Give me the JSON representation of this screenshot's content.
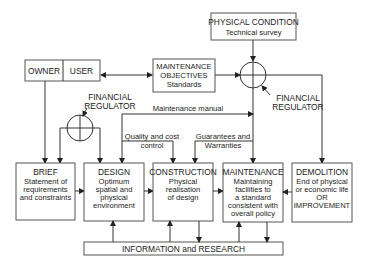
{
  "nodes": {
    "physical_condition": {
      "title": "PHYSICAL CONDITION",
      "sub": "Technical survey"
    },
    "maintenance_objectives": {
      "l1": "MAINTENANCE",
      "l2": "OBJECTIVES",
      "l3": "Standards"
    },
    "owner": "OWNER",
    "user": "USER",
    "brief": {
      "title": "BRIEF",
      "l1": "Statement of",
      "l2": "requirements",
      "l3": "and constraints"
    },
    "design": {
      "title": "DESIGN",
      "l1": "Optimum",
      "l2": "spatial and",
      "l3": "physical",
      "l4": "environment"
    },
    "construction": {
      "title": "CONSTRUCTION",
      "l1": "Physical",
      "l2": "realisation",
      "l3": "of design"
    },
    "maintenance": {
      "title": "MAINTENANCE",
      "l1": "Maintaining",
      "l2": "facilities to",
      "l3": "a standard",
      "l4": "consistent with",
      "l5": "overall policy"
    },
    "demolition": {
      "title": "DEMOLITION",
      "l1": "End of physical",
      "l2": "or economic life",
      "l3": "OR",
      "l4": "IMPROVEMENT"
    },
    "information": "INFORMATION and RESEARCH"
  },
  "labels": {
    "fin_reg_left": {
      "l1": "FINANCIAL",
      "l2": "REGULATOR"
    },
    "fin_reg_right": {
      "l1": "FINANCIAL",
      "l2": "REGULATOR"
    },
    "maintenance_manual": "Maintenance manual",
    "quality_cost": {
      "l1": "Quality and cost",
      "l2": "control"
    },
    "guarantees": {
      "l1": "Guarantees and",
      "l2": "Warranties"
    }
  }
}
